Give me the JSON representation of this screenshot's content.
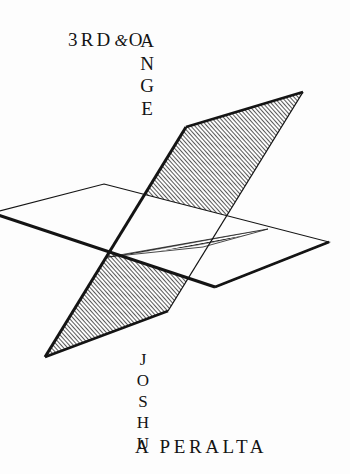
{
  "cover": {
    "background_color": "#fdfdfd",
    "ink_color": "#141414"
  },
  "title": {
    "full": "3RD & ORANGE",
    "first_line": "3RD",
    "ampersand": "&",
    "horizontal_tail": "O",
    "vertical_word": "ORANGE",
    "vertical_letters": [
      "O",
      "R",
      "A",
      "N",
      "G",
      "E"
    ],
    "vertical_letters_after_first": [
      "R",
      "A",
      "N",
      "G",
      "E"
    ]
  },
  "author": {
    "full": "JOSHUA A PERALTA",
    "first_name": "JOSHUA",
    "first_name_letters": [
      "J",
      "O",
      "S",
      "H",
      "U"
    ],
    "last_line": "A PERALTA"
  },
  "artwork": {
    "name": "two-intersecting-planes-diagram",
    "description": "A steeply tilted parallelogram plane with dense diagonal hatching passes through a plain horizontal parallelogram plane; the wedge of the tilted plane lying behind the horizontal plane is drawn with horizontal line hatching.",
    "stroke_color": "#141414",
    "hatch_color": "#1a1a1a",
    "fill_color": "#fdfdfd",
    "tilted_plane": {
      "name": "diagonal-hatched-plane",
      "points": "186,127 303,92 168,311 45,357"
    },
    "horizontal_plane": {
      "name": "horizontal-plane",
      "points": "104,184 329,242 215,287 -8,213"
    },
    "behind_wedge": {
      "name": "horizontal-hatched-wedge",
      "points": "108,257 268,229 203,246"
    },
    "intersection_point": "108,257"
  }
}
